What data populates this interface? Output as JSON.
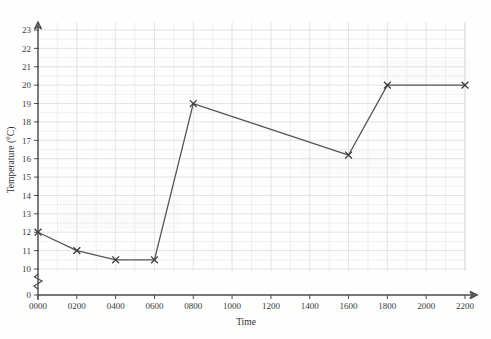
{
  "chart_data": {
    "type": "line",
    "title": "",
    "xlabel": "Time",
    "ylabel": "Temperature (°C)",
    "x": [
      "0000",
      "0200",
      "0400",
      "0600",
      "0800",
      "1600",
      "1800",
      "2200"
    ],
    "values": [
      12,
      11,
      10.5,
      10.5,
      19,
      16.2,
      20,
      20
    ],
    "series": [
      {
        "name": "Temperature",
        "points": [
          {
            "x": "0000",
            "y": 12
          },
          {
            "x": "0200",
            "y": 11
          },
          {
            "x": "0400",
            "y": 10.5
          },
          {
            "x": "0600",
            "y": 10.5
          },
          {
            "x": "0800",
            "y": 19
          },
          {
            "x": "1600",
            "y": 16.2
          },
          {
            "x": "1800",
            "y": 20
          },
          {
            "x": "2200",
            "y": 20
          }
        ],
        "marker": "cross",
        "color": "#555555"
      }
    ],
    "xtick_labels": [
      "0000",
      "0200",
      "0400",
      "0600",
      "0800",
      "1000",
      "1200",
      "1400",
      "1600",
      "1800",
      "2000",
      "2200"
    ],
    "xlim": [
      0,
      2300
    ],
    "ytick_labels": [
      "0",
      "10",
      "11",
      "12",
      "13",
      "14",
      "15",
      "16",
      "17",
      "18",
      "19",
      "20",
      "21",
      "22",
      "23"
    ],
    "ylim": [
      10,
      23
    ],
    "y_axis_break": true,
    "grid": true,
    "grid_minor": true,
    "legend": "none",
    "line_color": "#555555",
    "grid_color": "#d8d8dc",
    "axis_color": "#4a4a4a",
    "background_color": "#fefefe"
  },
  "axis": {
    "x_title": "Time",
    "y_title": "Temperature (°C)"
  }
}
